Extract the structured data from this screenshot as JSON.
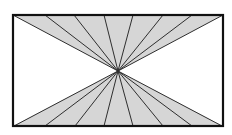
{
  "diagram": {
    "type": "geometric-figure",
    "frame": {
      "x1": 13,
      "y1": 15,
      "x2": 223,
      "y2": 126,
      "stroke": "#111111",
      "stroke_width": 2.2
    },
    "center": {
      "x": 118,
      "y": 71
    },
    "fill_color": "#d6d6d6",
    "line_color": "#2e2e2e",
    "line_width": 1,
    "top_fan_x": [
      13,
      45,
      74,
      104,
      133,
      163,
      192,
      223
    ],
    "bottom_fan_x": [
      14,
      45,
      75,
      104,
      133,
      163,
      192,
      222
    ]
  }
}
